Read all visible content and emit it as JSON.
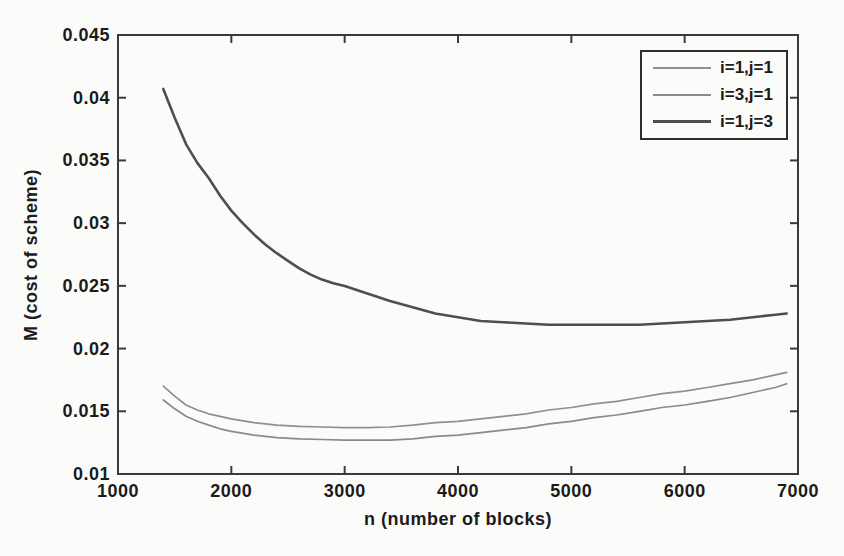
{
  "figure": {
    "background": "#fbfbf9",
    "axis_color": "#3a3a3a",
    "text_color": "#1b1b1b"
  },
  "chart_data": {
    "type": "line",
    "title": "",
    "xlabel": "n  (number of blocks)",
    "ylabel": "M  (cost of scheme)",
    "xlim": [
      1000,
      7000
    ],
    "ylim": [
      0.01,
      0.045
    ],
    "x_tick_values": [
      1000,
      2000,
      3000,
      4000,
      5000,
      6000,
      7000
    ],
    "x_tick_labels": [
      "1000",
      "2000",
      "3000",
      "4000",
      "5000",
      "6000",
      "7000"
    ],
    "y_tick_values": [
      0.01,
      0.015,
      0.02,
      0.025,
      0.03,
      0.035,
      0.04,
      0.045
    ],
    "y_tick_labels": [
      "0.01",
      "0.015",
      "0.02",
      "0.025",
      "0.03",
      "0.035",
      "0.04",
      "0.045"
    ],
    "grid": false,
    "legend_position": "top-right",
    "series": [
      {
        "name": "i=1,j=1",
        "color": "#8f8f8f",
        "width": 1.7,
        "points": [
          [
            1400,
            0.017
          ],
          [
            1500,
            0.0162
          ],
          [
            1600,
            0.0155
          ],
          [
            1700,
            0.0151
          ],
          [
            1800,
            0.0148
          ],
          [
            1900,
            0.0146
          ],
          [
            2000,
            0.0144
          ],
          [
            2200,
            0.0141
          ],
          [
            2400,
            0.0139
          ],
          [
            2600,
            0.0138
          ],
          [
            2800,
            0.01375
          ],
          [
            3000,
            0.0137
          ],
          [
            3200,
            0.0137
          ],
          [
            3400,
            0.01375
          ],
          [
            3600,
            0.0139
          ],
          [
            3800,
            0.0141
          ],
          [
            4000,
            0.0142
          ],
          [
            4200,
            0.0144
          ],
          [
            4400,
            0.0146
          ],
          [
            4600,
            0.0148
          ],
          [
            4800,
            0.0151
          ],
          [
            5000,
            0.0153
          ],
          [
            5200,
            0.0156
          ],
          [
            5400,
            0.0158
          ],
          [
            5600,
            0.0161
          ],
          [
            5800,
            0.0164
          ],
          [
            6000,
            0.0166
          ],
          [
            6200,
            0.0169
          ],
          [
            6400,
            0.0172
          ],
          [
            6600,
            0.0175
          ],
          [
            6800,
            0.0179
          ],
          [
            6900,
            0.0181
          ]
        ]
      },
      {
        "name": "i=3,j=1",
        "color": "#8a8a8a",
        "width": 1.7,
        "points": [
          [
            1400,
            0.0159
          ],
          [
            1500,
            0.0152
          ],
          [
            1600,
            0.0146
          ],
          [
            1700,
            0.0142
          ],
          [
            1800,
            0.0139
          ],
          [
            1900,
            0.0136
          ],
          [
            2000,
            0.0134
          ],
          [
            2200,
            0.0131
          ],
          [
            2400,
            0.0129
          ],
          [
            2600,
            0.0128
          ],
          [
            2800,
            0.01275
          ],
          [
            3000,
            0.0127
          ],
          [
            3200,
            0.0127
          ],
          [
            3400,
            0.0127
          ],
          [
            3600,
            0.0128
          ],
          [
            3800,
            0.013
          ],
          [
            4000,
            0.0131
          ],
          [
            4200,
            0.0133
          ],
          [
            4400,
            0.0135
          ],
          [
            4600,
            0.0137
          ],
          [
            4800,
            0.014
          ],
          [
            5000,
            0.0142
          ],
          [
            5200,
            0.0145
          ],
          [
            5400,
            0.0147
          ],
          [
            5600,
            0.015
          ],
          [
            5800,
            0.0153
          ],
          [
            6000,
            0.0155
          ],
          [
            6200,
            0.0158
          ],
          [
            6400,
            0.0161
          ],
          [
            6600,
            0.0165
          ],
          [
            6800,
            0.0169
          ],
          [
            6900,
            0.0172
          ]
        ]
      },
      {
        "name": "i=1,j=3",
        "color": "#4e4e4e",
        "width": 2.6,
        "points": [
          [
            1400,
            0.0407
          ],
          [
            1500,
            0.0384
          ],
          [
            1600,
            0.0363
          ],
          [
            1700,
            0.0348
          ],
          [
            1800,
            0.0336
          ],
          [
            1900,
            0.0322
          ],
          [
            2000,
            0.031
          ],
          [
            2100,
            0.03
          ],
          [
            2200,
            0.0291
          ],
          [
            2300,
            0.0283
          ],
          [
            2400,
            0.0276
          ],
          [
            2500,
            0.027
          ],
          [
            2600,
            0.0264
          ],
          [
            2700,
            0.0259
          ],
          [
            2800,
            0.0255
          ],
          [
            2900,
            0.0252
          ],
          [
            3000,
            0.025
          ],
          [
            3200,
            0.0244
          ],
          [
            3400,
            0.0238
          ],
          [
            3600,
            0.0233
          ],
          [
            3800,
            0.0228
          ],
          [
            4000,
            0.0225
          ],
          [
            4200,
            0.0222
          ],
          [
            4400,
            0.0221
          ],
          [
            4600,
            0.022
          ],
          [
            4800,
            0.0219
          ],
          [
            5000,
            0.0219
          ],
          [
            5200,
            0.0219
          ],
          [
            5400,
            0.0219
          ],
          [
            5600,
            0.0219
          ],
          [
            5800,
            0.022
          ],
          [
            6000,
            0.0221
          ],
          [
            6200,
            0.0222
          ],
          [
            6400,
            0.0223
          ],
          [
            6600,
            0.0225
          ],
          [
            6800,
            0.0227
          ],
          [
            6900,
            0.0228
          ]
        ]
      }
    ]
  }
}
